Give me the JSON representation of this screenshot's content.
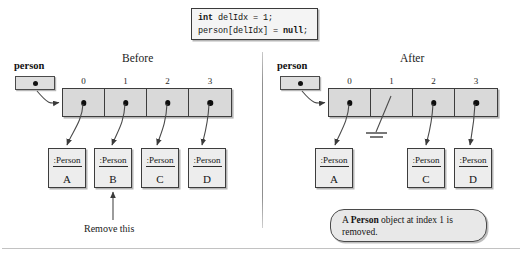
{
  "figure": {
    "code_snippet": {
      "line1_keyword": "int",
      "line1_rest": " delIdx = 1;",
      "line2_start": "person[delIdx] = ",
      "line2_keyword": "null",
      "line2_end": ";"
    },
    "before": {
      "title": "Before",
      "variable_label": "person",
      "indices": [
        "0",
        "1",
        "2",
        "3"
      ],
      "cells_filled": [
        true,
        true,
        true,
        true
      ],
      "objects": [
        {
          "type": ":Person",
          "value": "A"
        },
        {
          "type": ":Person",
          "value": "B"
        },
        {
          "type": ":Person",
          "value": "C"
        },
        {
          "type": ":Person",
          "value": "D"
        }
      ],
      "annotation": "Remove this"
    },
    "after": {
      "title": "After",
      "variable_label": "person",
      "indices": [
        "0",
        "1",
        "2",
        "3"
      ],
      "cells_filled": [
        true,
        false,
        true,
        true
      ],
      "objects": [
        {
          "type": ":Person",
          "value": "A"
        },
        {
          "type": ":Person",
          "value": "C"
        },
        {
          "type": ":Person",
          "value": "D"
        }
      ],
      "callout": {
        "part1": "A ",
        "bold": "Person",
        "part2": " object at index 1 is removed."
      }
    }
  }
}
